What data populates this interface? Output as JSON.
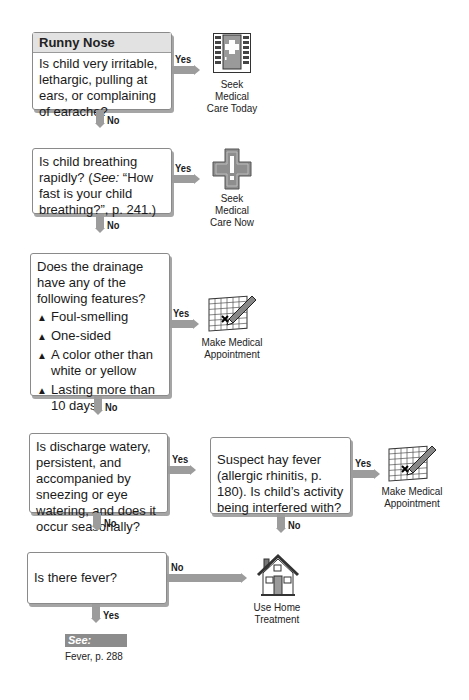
{
  "title": "Runny Nose",
  "nodes": {
    "q1": {
      "text": "Is child very irritable, lethargic, pulling at ears, or complaining of earache?",
      "yes": "Yes",
      "no": "No"
    },
    "q2": {
      "text_pre": "Is child breathing rapidly? (",
      "text_see": "See:",
      "text_post": " “How fast is your child breathing?”, p. 241.)",
      "yes": "Yes",
      "no": "No"
    },
    "q3": {
      "text": "Does the drainage have any of the following features?",
      "bullets": [
        "Foul-smelling",
        "One-sided",
        "A color other than white or yellow",
        "Lasting more than 10 days"
      ],
      "bullet_glyph": "▲",
      "yes": "Yes",
      "no": "No"
    },
    "q4": {
      "text": "Is discharge watery, persistent, and accompanied by sneezing or eye watering, and does it occur seasonally?",
      "yes": "Yes",
      "no": "No"
    },
    "q5": {
      "text": "Suspect hay fever (allergic rhinitis, p. 180). Is child’s activity being interfered with?",
      "yes": "Yes",
      "no": "No"
    },
    "q6": {
      "text": "Is there fever?",
      "no": "No",
      "yes": "Yes"
    }
  },
  "outcomes": {
    "care_today": {
      "icon": "medical-door-icon",
      "line1": "Seek Medical",
      "line2": "Care Today"
    },
    "care_now": {
      "icon": "emergency-cross-icon",
      "line1": "Seek Medical",
      "line2": "Care Now"
    },
    "appointment1": {
      "icon": "calendar-pencil-icon",
      "line1": "Make Medical",
      "line2": "Appointment"
    },
    "appointment2": {
      "icon": "calendar-pencil-icon",
      "line1": "Make Medical",
      "line2": "Appointment"
    },
    "home": {
      "icon": "house-icon",
      "line1": "Use Home",
      "line2": "Treatment"
    }
  },
  "see_also": {
    "label": "See:",
    "ref": "Fever, p. 288"
  },
  "colors": {
    "arrow": "#9c9c9c",
    "header_bg": "#e2e2e2",
    "see_bg": "#8c8c8c"
  }
}
